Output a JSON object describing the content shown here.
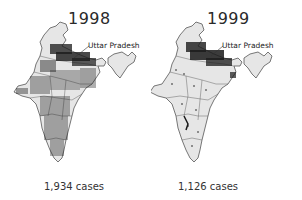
{
  "figure": {
    "panels": [
      {
        "year": "1998",
        "annotation": "Uttar Pradesh",
        "cases_label": "1,934 cases",
        "cases": 1934,
        "dot_density": "high, widespread across country, concentrated in north"
      },
      {
        "year": "1999",
        "annotation": "Uttar Pradesh",
        "cases_label": "1,126 cases",
        "cases": 1126,
        "dot_density": "concentrated in Uttar Pradesh / north, sparse elsewhere"
      }
    ],
    "colors": {
      "land_fill": "#e6e6e6",
      "border": "#555555",
      "dots": "#1a1a1a",
      "background": "#ffffff"
    }
  }
}
